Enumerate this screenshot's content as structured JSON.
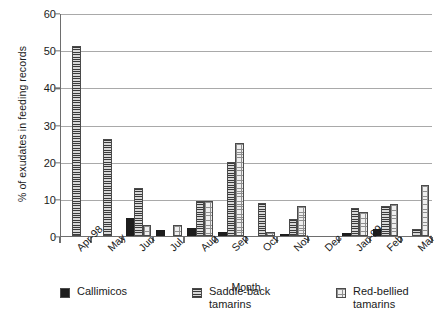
{
  "chart_data": {
    "type": "bar",
    "title": "",
    "xlabel": "Month",
    "ylabel": "% of exudates in feeding records",
    "ylim": [
      0,
      60
    ],
    "yticks": [
      0,
      10,
      20,
      30,
      40,
      50,
      60
    ],
    "grid": "horizontal",
    "legend_position": "bottom",
    "categories": [
      "Apr-98",
      "May",
      "Jun",
      "Jul",
      "Aug",
      "Sep",
      "Oct",
      "Nov",
      "Dec",
      "Jan-99",
      "Feb",
      "Mar"
    ],
    "series": [
      {
        "name": "Callimicos",
        "color": "#1d1d1d",
        "fill": "solid",
        "values": [
          0,
          0,
          4.8,
          1.6,
          2.1,
          1.0,
          0,
          0.5,
          0,
          0.8,
          1.8,
          0
        ]
      },
      {
        "name": "Saddle-back tamarins",
        "color": "#b9b9b9",
        "fill": "horizontal-lines",
        "values": [
          51,
          26,
          12.8,
          0,
          9.5,
          20,
          9.0,
          4.5,
          0,
          7.5,
          8.0,
          2.0
        ]
      },
      {
        "name": "Red-bellied tamarins",
        "color": "#efefef",
        "fill": "dotted",
        "values": [
          0,
          0,
          3.0,
          3.0,
          9.5,
          25,
          1.0,
          8.0,
          0,
          6.5,
          8.5,
          13.8
        ]
      }
    ]
  },
  "legend": {
    "items": [
      {
        "label_line1": "Callimicos",
        "label_line2": ""
      },
      {
        "label_line1": "Saddle-back",
        "label_line2": "tamarins"
      },
      {
        "label_line1": "Red-bellied",
        "label_line2": "tamarins"
      }
    ]
  }
}
